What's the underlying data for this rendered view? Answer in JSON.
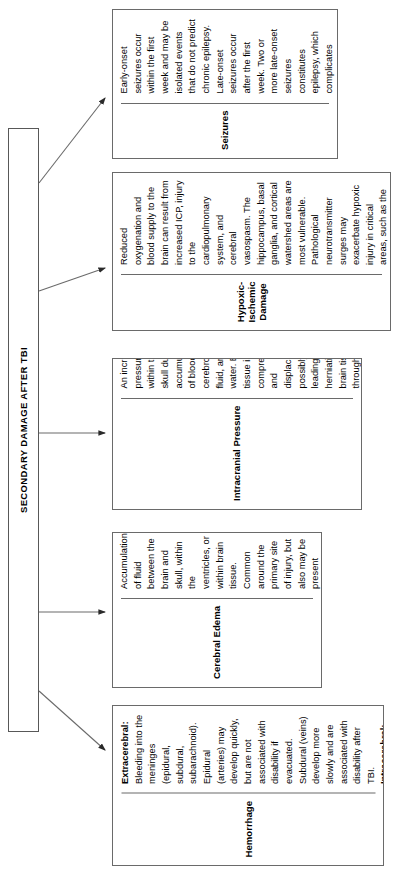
{
  "diagram": {
    "type": "flowchart",
    "orientation": "rotated-90-ccw",
    "root": {
      "label": "SECONDARY DAMAGE AFTER TBI"
    },
    "nodes": [
      {
        "id": "seizures",
        "title": "Seizures",
        "body": "Early-onset seizures occur within the first week and may be isolated events that do not predict chronic epilepsy. Late-onset seizures occur after the first week. Two or more late-onset seizures constitutes epilepsy, which complicates recovery and community integration."
      },
      {
        "id": "hypoxic-ischemic-damage",
        "title": "Hypoxic-Ischemic Damage",
        "body": "Reduced oxygenation and blood supply to the brain can result from increased ICP, injury to the cardiopulmonary system, and cerebral vasospasm. The hippocampus, basal ganglia, and cortical watershed areas are most vulnerable. Pathological neurotransmitter surges may exacerbate hypoxic injury in critical areas, such as the hippocampus. Diffuse HII is associated with severe DAI."
      },
      {
        "id": "intracranial-pressure",
        "title": "Intracranial Pressure",
        "body": "An increase of pressure within the skull due to accumulations of blood, cerebrospinal fluid, and/or water. Brain tissue is compressed and displaced, possibly leading to herniation of brain tissue through orifices or against bony processes. Emergency medical management after TBI is directed largely to dangerous elevation of ICP."
      },
      {
        "id": "cerebral-edema",
        "title": "Cerebral Edema",
        "body": "Accumulation of fluid between the brain and skull, within the ventricles, or within brain tissue. Common around the primary site of injury, but also may be present throughout the brain in diffuse axonal injury. Contributes to increased intracranial pressure."
      },
      {
        "id": "hemorrhage",
        "title": "Hemorrhage",
        "body_segments": [
          {
            "text": "Extracerebral:",
            "bold": true
          },
          {
            "text": " Bleeding into the meninges (epidural, subdural, subarachnoid). Epidural (arteries) may develop quickly, but are not associated with disability if evacuated. Subdural (veins) develop more slowly and are associated with disability after TBI. ",
            "bold": false
          },
          {
            "text": "Intracerebral:",
            "bold": true
          },
          {
            "text": " Bleeding into brain tissue. Associated with diffuse axonal injury.",
            "bold": false
          }
        ]
      }
    ],
    "connectors": [
      {
        "from": "root",
        "to": "seizures"
      },
      {
        "from": "root",
        "to": "hypoxic-ischemic-damage"
      },
      {
        "from": "root",
        "to": "intracranial-pressure"
      },
      {
        "from": "root",
        "to": "cerebral-edema"
      },
      {
        "from": "root",
        "to": "hemorrhage"
      }
    ],
    "colors": {
      "background": "#ffffff",
      "text": "#000000",
      "border": "#6a6a6a",
      "connector": "#6a6a6a"
    }
  }
}
